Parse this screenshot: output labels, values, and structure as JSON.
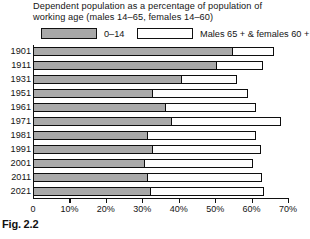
{
  "title": {
    "line1": "Dependent population as a percentage of population of",
    "line2": "working age (males 14–65, females 14–60)"
  },
  "legend": {
    "position": "top",
    "entries": [
      {
        "label": "0–14",
        "swatch": "grey",
        "color": "#a9a9a9"
      },
      {
        "label": "Males 65 +  & females 60 +",
        "swatch": "white",
        "color": "#ffffff"
      }
    ]
  },
  "caption": "Fig. 2.2",
  "axis": {
    "x_ticks": [
      "0",
      "10%",
      "20%",
      "30%",
      "40%",
      "50%",
      "60%",
      "70%"
    ],
    "x_tick_values": [
      0,
      10,
      20,
      30,
      40,
      50,
      60,
      70
    ]
  },
  "chart_data": {
    "type": "bar",
    "orientation": "horizontal",
    "stacked": true,
    "title": "Dependent population as a percentage of population of working age (males 14–65, females 14–60)",
    "xlabel": "",
    "ylabel": "",
    "xlim": [
      0,
      70
    ],
    "grid": false,
    "legend_position": "top",
    "categories": [
      "1901",
      "1911",
      "1931",
      "1951",
      "1961",
      "1971",
      "1981",
      "1991",
      "2001",
      "2011",
      "2021"
    ],
    "series": [
      {
        "name": "0–14",
        "color": "#a9a9a9",
        "values": [
          54.7,
          50.1,
          40.6,
          32.8,
          36.2,
          38.0,
          31.4,
          32.6,
          30.4,
          31.2,
          32.0
        ]
      },
      {
        "name": "Males 65 +  & females 60 +",
        "color": "#ffffff",
        "values": [
          11.4,
          13.0,
          15.5,
          26.1,
          25.0,
          30.0,
          29.8,
          30.1,
          29.9,
          31.6,
          31.4
        ]
      }
    ],
    "totals": [
      66.1,
      63.1,
      56.1,
      58.9,
      61.2,
      68.0,
      61.2,
      62.7,
      60.3,
      62.8,
      63.4
    ]
  }
}
